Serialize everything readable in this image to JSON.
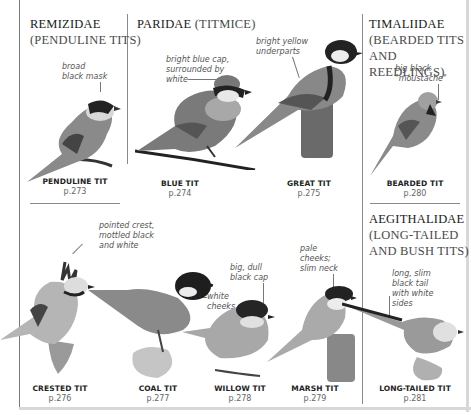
{
  "families": [
    {
      "id": "remizidae",
      "name": "REMIZIDAE",
      "sub": "(PENDULINE TITS)"
    },
    {
      "id": "paridae",
      "name": "PARIDAE",
      "sub": "(TITMICE)"
    },
    {
      "id": "timaliidae",
      "name": "TIMALIIDAE",
      "sub_line1": "(BEARDED TITS",
      "sub_line2": "AND REEDLINGS)"
    },
    {
      "id": "aegithalidae",
      "name": "AEGITHALIDAE",
      "sub_line1": "(LONG-TAILED",
      "sub_line2": "AND BUSH TITS)"
    }
  ],
  "birds": [
    {
      "name": "PENDULINE TIT",
      "page": "p.273",
      "note": [
        "broad",
        "black mask"
      ]
    },
    {
      "name": "BLUE TIT",
      "page": "p.274",
      "note": [
        "bright blue cap,",
        "surrounded by",
        "white"
      ]
    },
    {
      "name": "GREAT TIT",
      "page": "p.275",
      "note": [
        "bright yellow",
        "underparts"
      ]
    },
    {
      "name": "BEARDED TIT",
      "page": "p.280",
      "note": [
        "big black",
        "\"moustache\""
      ]
    },
    {
      "name": "CRESTED TIT",
      "page": "p.276",
      "note": [
        "pointed crest,",
        "mottled black",
        "and white"
      ]
    },
    {
      "name": "COAL TIT",
      "page": "p.277",
      "note": [
        "white",
        "cheeks"
      ]
    },
    {
      "name": "WILLOW TIT",
      "page": "p.278",
      "note": [
        "big, dull",
        "black cap"
      ]
    },
    {
      "name": "MARSH TIT",
      "page": "p.279",
      "note": [
        "pale",
        "cheeks;",
        "slim neck"
      ]
    },
    {
      "name": "LONG-TAILED TIT",
      "page": "p.281",
      "note": [
        "long, slim",
        "black tail",
        "with white",
        "sides"
      ]
    }
  ],
  "colors": {
    "border": "#7a7a7a",
    "text": "#222222",
    "note_text": "#555555",
    "page_text": "#666666"
  }
}
